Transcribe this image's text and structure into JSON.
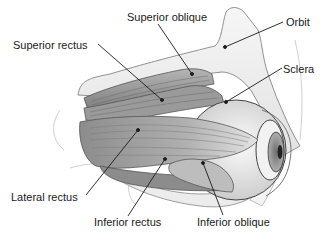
{
  "diagram": {
    "labels": {
      "superior_oblique": "Superior oblique",
      "superior_rectus": "Superior rectus",
      "orbit": "Orbit",
      "sclera": "Sclera",
      "lateral_rectus": "Lateral rectus",
      "inferior_rectus": "Inferior rectus",
      "inferior_oblique": "Inferior oblique"
    },
    "colors": {
      "background": "#ffffff",
      "bone": "#f0f0f0",
      "muscle_dark": "#8a8a8a",
      "muscle_mid": "#a8a8a8",
      "muscle_light": "#cfcfcf",
      "sclera": "#eeeeee",
      "iris": "#9a9a9a",
      "outline": "#444444",
      "leader_line": "#1a1a1a"
    }
  }
}
